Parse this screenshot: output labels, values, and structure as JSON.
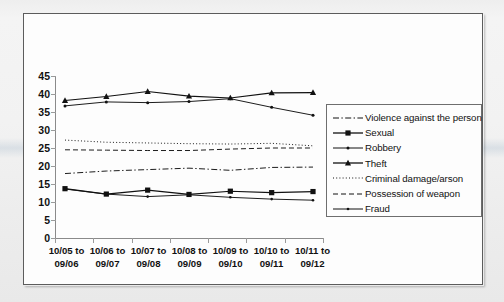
{
  "chart_data": {
    "type": "line",
    "title": "",
    "xlabel": "",
    "ylabel": "",
    "ylim": [
      0,
      45
    ],
    "ytick_step": 5,
    "grid": false,
    "legend_position": "right",
    "yticks": [
      "45",
      "40",
      "35",
      "30",
      "25",
      "20",
      "15",
      "10",
      "5",
      "0"
    ],
    "categories": [
      {
        "line1": "10/05 to",
        "line2": "09/06"
      },
      {
        "line1": "10/06 to",
        "line2": "09/07"
      },
      {
        "line1": "10/07 to",
        "line2": "09/08"
      },
      {
        "line1": "10/08 to",
        "line2": "09/09"
      },
      {
        "line1": "10/09 to",
        "line2": "09/10"
      },
      {
        "line1": "10/10 to",
        "line2": "09/11"
      },
      {
        "line1": "10/11 to",
        "line2": "09/12"
      }
    ],
    "series": [
      {
        "name": "Violence against the person",
        "style": "dashdot",
        "marker": "none",
        "values": [
          17.9,
          18.6,
          19.0,
          19.4,
          18.8,
          19.6,
          19.7
        ]
      },
      {
        "name": "Sexual",
        "style": "solid",
        "marker": "square",
        "values": [
          13.7,
          12.2,
          13.3,
          12.1,
          13.0,
          12.6,
          12.9
        ]
      },
      {
        "name": "Robbery",
        "style": "solid",
        "marker": "dot",
        "values": [
          36.7,
          37.8,
          37.6,
          37.9,
          38.7,
          36.3,
          34.1
        ]
      },
      {
        "name": "Theft",
        "style": "solid",
        "marker": "triangle",
        "values": [
          38.2,
          39.3,
          40.7,
          39.4,
          38.9,
          40.3,
          40.4
        ]
      },
      {
        "name": "Criminal damage/arson",
        "style": "dotted",
        "marker": "none",
        "values": [
          27.2,
          26.6,
          26.4,
          26.2,
          26.1,
          26.3,
          25.6
        ]
      },
      {
        "name": "Possession of weapon",
        "style": "dashed",
        "marker": "none",
        "values": [
          24.5,
          24.4,
          24.3,
          24.3,
          24.7,
          25.0,
          25.0
        ]
      },
      {
        "name": "Fraud",
        "style": "solid",
        "marker": "smalldot",
        "values": [
          13.6,
          12.2,
          11.5,
          12.0,
          11.3,
          10.8,
          10.5
        ]
      }
    ]
  },
  "legend": {
    "entries": [
      "Violence against the person",
      "Sexual",
      "Robbery",
      "Theft",
      "Criminal damage/arson",
      "Possession of weapon",
      "Fraud"
    ]
  },
  "colors": {
    "ink": "#111111",
    "axis": "#8a8a8a",
    "frame": "#5c5c5c",
    "plot_bg": "#fdfdfd",
    "page_bg": "#f1f1f1"
  }
}
